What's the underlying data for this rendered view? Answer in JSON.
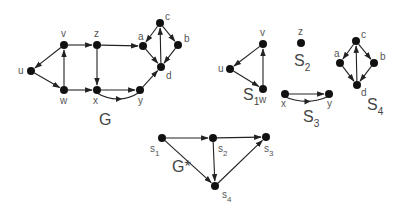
{
  "graphs": {
    "G": {
      "title": "G",
      "title_pos": [
        99,
        125
      ],
      "nodes": [
        {
          "id": "u",
          "label": "u",
          "x": 31,
          "y": 71,
          "lx": 18,
          "ly": 74
        },
        {
          "id": "v",
          "label": "v",
          "x": 64,
          "y": 45,
          "lx": 61,
          "ly": 37
        },
        {
          "id": "z",
          "label": "z",
          "x": 97,
          "y": 45,
          "lx": 94,
          "ly": 37
        },
        {
          "id": "w",
          "label": "w",
          "x": 64,
          "y": 90,
          "lx": 60,
          "ly": 104
        },
        {
          "id": "x",
          "label": "x",
          "x": 97,
          "y": 90,
          "lx": 93,
          "ly": 104
        },
        {
          "id": "y",
          "label": "y",
          "x": 140,
          "y": 90,
          "lx": 138,
          "ly": 104
        },
        {
          "id": "a",
          "label": "a",
          "x": 143,
          "y": 46,
          "lx": 138,
          "ly": 40
        },
        {
          "id": "c",
          "label": "c",
          "x": 160,
          "y": 23,
          "lx": 165,
          "ly": 20
        },
        {
          "id": "b",
          "label": "b",
          "x": 178,
          "y": 45,
          "lx": 184,
          "ly": 42
        },
        {
          "id": "d",
          "label": "d",
          "x": 161,
          "y": 67,
          "lx": 166,
          "ly": 79
        }
      ],
      "edges": [
        {
          "from": "v",
          "to": "u"
        },
        {
          "from": "u",
          "to": "w"
        },
        {
          "from": "w",
          "to": "v"
        },
        {
          "from": "v",
          "to": "z"
        },
        {
          "from": "z",
          "to": "x"
        },
        {
          "from": "w",
          "to": "x"
        },
        {
          "from": "z",
          "to": "a"
        },
        {
          "from": "x",
          "to": "y"
        },
        {
          "from": "y",
          "to": "x",
          "curve": 10
        },
        {
          "from": "y",
          "to": "d"
        },
        {
          "from": "c",
          "to": "a"
        },
        {
          "from": "c",
          "to": "b"
        },
        {
          "from": "a",
          "to": "d"
        },
        {
          "from": "b",
          "to": "d"
        },
        {
          "from": "d",
          "to": "c"
        }
      ]
    },
    "S1": {
      "title": "S",
      "sub": "1",
      "title_pos": [
        243,
        100
      ],
      "nodes": [
        {
          "id": "v",
          "label": "v",
          "x": 263,
          "y": 44,
          "lx": 260,
          "ly": 36
        },
        {
          "id": "u",
          "label": "u",
          "x": 230,
          "y": 69,
          "lx": 218,
          "ly": 72
        },
        {
          "id": "w",
          "label": "w",
          "x": 263,
          "y": 89,
          "lx": 259,
          "ly": 103
        }
      ],
      "edges": [
        {
          "from": "v",
          "to": "u"
        },
        {
          "from": "u",
          "to": "w"
        },
        {
          "from": "w",
          "to": "v"
        }
      ]
    },
    "S2": {
      "title": "S",
      "sub": "2",
      "title_pos": [
        294,
        66
      ],
      "nodes": [
        {
          "id": "z",
          "label": "z",
          "x": 301,
          "y": 43,
          "lx": 298,
          "ly": 35
        }
      ],
      "edges": []
    },
    "S3": {
      "title": "S",
      "sub": "3",
      "title_pos": [
        303,
        122
      ],
      "nodes": [
        {
          "id": "x",
          "label": "x",
          "x": 285,
          "y": 94,
          "lx": 281,
          "ly": 107
        },
        {
          "id": "y",
          "label": "y",
          "x": 329,
          "y": 94,
          "lx": 327,
          "ly": 107
        }
      ],
      "edges": [
        {
          "from": "x",
          "to": "y"
        },
        {
          "from": "y",
          "to": "x",
          "curve": 8
        }
      ]
    },
    "S4": {
      "title": "S",
      "sub": "4",
      "title_pos": [
        367,
        110
      ],
      "nodes": [
        {
          "id": "c",
          "label": "c",
          "x": 356,
          "y": 41,
          "lx": 361,
          "ly": 38
        },
        {
          "id": "a",
          "label": "a",
          "x": 340,
          "y": 63,
          "lx": 334,
          "ly": 57
        },
        {
          "id": "b",
          "label": "b",
          "x": 374,
          "y": 63,
          "lx": 380,
          "ly": 60
        },
        {
          "id": "d",
          "label": "d",
          "x": 357,
          "y": 85,
          "lx": 361,
          "ly": 96
        }
      ],
      "edges": [
        {
          "from": "c",
          "to": "a"
        },
        {
          "from": "c",
          "to": "b"
        },
        {
          "from": "a",
          "to": "d"
        },
        {
          "from": "b",
          "to": "d"
        },
        {
          "from": "d",
          "to": "c"
        }
      ]
    },
    "Gstar": {
      "title": "G*",
      "title_pos": [
        172,
        172
      ],
      "nodes": [
        {
          "id": "s1",
          "label": "s",
          "sub": "1",
          "x": 162,
          "y": 138,
          "lx": 150,
          "ly": 152
        },
        {
          "id": "s2",
          "label": "s",
          "sub": "2",
          "x": 213,
          "y": 138,
          "lx": 218,
          "ly": 152
        },
        {
          "id": "s3",
          "label": "s",
          "sub": "3",
          "x": 266,
          "y": 137,
          "lx": 264,
          "ly": 152
        },
        {
          "id": "s4",
          "label": "s",
          "sub": "4",
          "x": 215,
          "y": 186,
          "lx": 222,
          "ly": 198
        }
      ],
      "edges": [
        {
          "from": "s1",
          "to": "s2"
        },
        {
          "from": "s2",
          "to": "s3"
        },
        {
          "from": "s1",
          "to": "s4"
        },
        {
          "from": "s2",
          "to": "s4"
        },
        {
          "from": "s4",
          "to": "s3"
        }
      ]
    }
  }
}
